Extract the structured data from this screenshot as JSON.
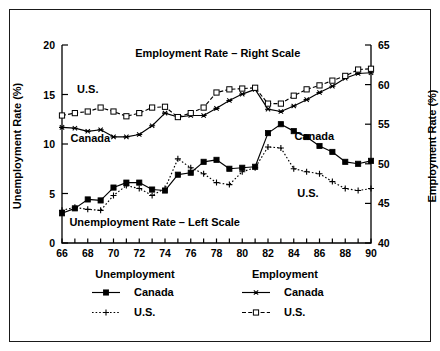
{
  "chart_data": {
    "type": "line",
    "title": "",
    "xlabel": "",
    "ylabel": "Unemployment Rate (%)",
    "ylabel_right": "Employment Rate (%)",
    "xlim": [
      66,
      90
    ],
    "ylim": [
      0,
      20
    ],
    "ylim_right": [
      40,
      65
    ],
    "xticks": [
      66,
      67,
      68,
      69,
      70,
      71,
      72,
      73,
      74,
      75,
      76,
      77,
      78,
      79,
      80,
      81,
      82,
      83,
      84,
      85,
      86,
      87,
      88,
      89,
      90
    ],
    "xtick_labels": [
      "66",
      "",
      "68",
      "",
      "70",
      "",
      "72",
      "",
      "74",
      "",
      "76",
      "",
      "78",
      "",
      "80",
      "",
      "82",
      "",
      "84",
      "",
      "86",
      "",
      "88",
      "",
      "90"
    ],
    "yticks_left": [
      0,
      5,
      10,
      15,
      20
    ],
    "ytick_labels_left": [
      "0",
      "5",
      "10",
      "15",
      "20"
    ],
    "yticks_right": [
      40,
      45,
      50,
      55,
      60,
      65
    ],
    "ytick_labels_right": [
      "40",
      "45",
      "50",
      "55",
      "60",
      "65"
    ],
    "grid": false,
    "legend_position": "below-plot",
    "x": [
      66,
      67,
      68,
      69,
      70,
      71,
      72,
      73,
      74,
      75,
      76,
      77,
      78,
      79,
      80,
      81,
      82,
      83,
      84,
      85,
      86,
      87,
      88,
      89,
      90
    ],
    "series": [
      {
        "name": "Canada",
        "group": "Unemployment",
        "axis": "left",
        "marker": "filled-square",
        "line_style": "solid",
        "values": [
          3.0,
          3.5,
          4.4,
          4.3,
          5.6,
          6.1,
          6.1,
          5.4,
          5.3,
          6.9,
          7.1,
          8.2,
          8.4,
          7.5,
          7.6,
          7.7,
          11.1,
          12.0,
          11.3,
          10.7,
          9.8,
          9.2,
          8.2,
          8.0,
          8.3
        ]
      },
      {
        "name": "U.S.",
        "group": "Unemployment",
        "axis": "left",
        "marker": "plus",
        "line_style": "dotted",
        "values": [
          3.3,
          3.6,
          3.4,
          3.3,
          4.8,
          5.8,
          5.5,
          4.8,
          5.5,
          8.5,
          7.6,
          7.0,
          6.1,
          5.9,
          7.2,
          7.6,
          9.7,
          9.6,
          7.5,
          7.2,
          7.0,
          6.2,
          5.5,
          5.3,
          5.5
        ]
      },
      {
        "name": "Canada",
        "group": "Employment",
        "axis": "right",
        "marker": "asterisk",
        "line_style": "solid",
        "values": [
          54.6,
          54.5,
          54.1,
          54.3,
          53.4,
          53.4,
          53.7,
          54.8,
          56.4,
          55.9,
          56.1,
          56.1,
          57.0,
          58.0,
          58.8,
          59.4,
          56.9,
          56.6,
          57.3,
          58.1,
          59.0,
          59.8,
          60.8,
          61.4,
          61.5
        ]
      },
      {
        "name": "U.S.",
        "group": "Employment",
        "axis": "right",
        "marker": "open-square",
        "line_style": "dashed",
        "values": [
          56.1,
          56.4,
          56.6,
          57.1,
          56.6,
          56.0,
          56.4,
          57.1,
          57.2,
          55.9,
          56.4,
          57.1,
          59.0,
          59.4,
          59.5,
          59.6,
          57.6,
          57.6,
          58.6,
          59.4,
          59.9,
          60.5,
          61.1,
          61.9,
          62.0
        ]
      }
    ],
    "annotations": [
      {
        "text": "Employment Rate – Right Scale",
        "x": 78.1,
        "y_left": 18.8
      },
      {
        "text": "Unemployment Rate – Left Scale",
        "x": 73.2,
        "y_left": 1.7
      },
      {
        "text": "U.S.",
        "x": 68.0,
        "y_left": 15.2
      },
      {
        "text": "Canada",
        "x": 68.2,
        "y_left": 10.2
      },
      {
        "text": "Canada",
        "x": 85.6,
        "y_left": 10.4
      },
      {
        "text": "U.S.",
        "x": 85.1,
        "y_left": 4.6
      }
    ]
  },
  "axes": {
    "left_title": "Unemployment Rate (%)",
    "right_title": "Employment Rate (%)"
  },
  "legend": {
    "columns": [
      {
        "header": "Unemployment",
        "entries": [
          {
            "label": "Canada",
            "marker": "filled-square",
            "line_style": "solid"
          },
          {
            "label": "U.S.",
            "marker": "plus",
            "line_style": "dotted"
          }
        ]
      },
      {
        "header": "Employment",
        "entries": [
          {
            "label": "Canada",
            "marker": "asterisk",
            "line_style": "solid"
          },
          {
            "label": "U.S.",
            "marker": "open-square",
            "line_style": "dashed"
          }
        ]
      }
    ]
  },
  "colors": {
    "line": "#000000",
    "frame": "#1a1a1a",
    "background": "#ffffff"
  }
}
